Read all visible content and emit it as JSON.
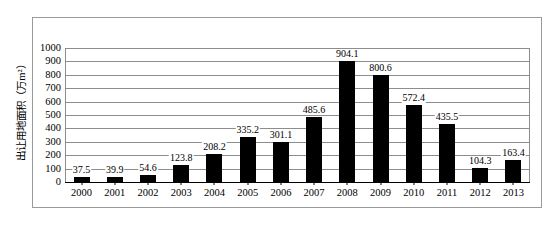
{
  "figure": {
    "y_axis_title": "出让用地面积（万m²）"
  },
  "chart_data": {
    "type": "bar",
    "title": "",
    "xlabel": "",
    "ylabel": "出让用地面积（万m²）",
    "categories": [
      "2000",
      "2001",
      "2002",
      "2003",
      "2004",
      "2005",
      "2006",
      "2007",
      "2008",
      "2009",
      "2010",
      "2011",
      "2012",
      "2013"
    ],
    "values": [
      37.5,
      39.9,
      54.6,
      123.8,
      208.2,
      335.2,
      301.1,
      485.6,
      904.1,
      800.6,
      572.4,
      435.5,
      104.3,
      163.4
    ],
    "value_labels": [
      "37.5",
      "39.9",
      "54.6",
      "123.8",
      "208.2",
      "335.2",
      "301.1",
      "485.6",
      "904.1",
      "800.6",
      "572.4",
      "435.5",
      "104.3",
      "163.4"
    ],
    "ylim": [
      0,
      1000
    ],
    "ytick_values": [
      0,
      100,
      200,
      300,
      400,
      500,
      600,
      700,
      800,
      900,
      1000
    ],
    "ytick_labels": [
      "0",
      "100",
      "200",
      "300",
      "400",
      "500",
      "600",
      "700",
      "800",
      "900",
      "1000"
    ],
    "grid": true,
    "legend": null,
    "bar_color": "#000000",
    "grid_color": "#8d8d8d",
    "frame_color": "#9a9a9a"
  }
}
